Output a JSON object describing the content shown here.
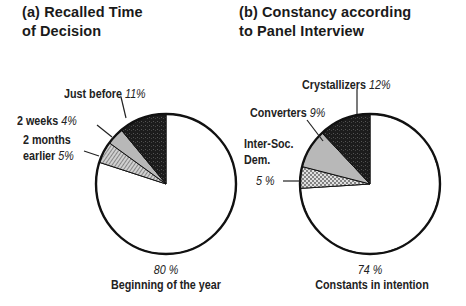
{
  "chart_data": [
    {
      "type": "pie",
      "title": "(a) Recalled Time of Decision",
      "title_lines": [
        "(a) Recalled Time",
        "of Decision"
      ],
      "start_angle": "12 o'clock, counterclockwise for small slices",
      "slices": [
        {
          "label": "Beginning of the year",
          "value": 80,
          "value_label": "80 %",
          "fill": "white"
        },
        {
          "label": "2 months earlier",
          "value": 5,
          "value_label": "5%",
          "fill": "hatched-gray"
        },
        {
          "label": "2 weeks",
          "value": 4,
          "value_label": "4%",
          "fill": "light-gray"
        },
        {
          "label": "Just before",
          "value": 11,
          "value_label": "11%",
          "fill": "black-stippled"
        }
      ]
    },
    {
      "type": "pie",
      "title": "(b) Constancy according to Panel Interview",
      "title_lines": [
        "(b) Constancy according",
        "to Panel Interview"
      ],
      "slices": [
        {
          "label": "Constants in intention",
          "value": 74,
          "value_label": "74 %",
          "fill": "white"
        },
        {
          "label": "Inter-Soc. Dem.",
          "value": 5,
          "value_label": "5 %",
          "fill": "dotted-gray"
        },
        {
          "label": "Converters",
          "value": 9,
          "value_label": "9%",
          "fill": "light-gray"
        },
        {
          "label": "Crystallizers",
          "value": 12,
          "value_label": "12%",
          "fill": "black-stippled"
        }
      ]
    }
  ],
  "titles": {
    "a_line1": "(a) Recalled Time",
    "a_line2": "of Decision",
    "b_line1": "(b) Constancy according",
    "b_line2": "to Panel Interview"
  },
  "labels_a": {
    "just_before": "Just before",
    "just_before_pct": "11%",
    "two_weeks": "2 weeks",
    "two_weeks_pct": "4%",
    "two_months_1": "2 months",
    "two_months_2": "earlier",
    "two_months_pct": "5%",
    "beginning_pct": "80 %",
    "beginning": "Beginning of the year"
  },
  "labels_b": {
    "crystallizers": "Crystallizers",
    "crystallizers_pct": "12%",
    "converters": "Converters",
    "converters_pct": "9%",
    "intersoc_1": "Inter-Soc.",
    "intersoc_2": "Dem.",
    "intersoc_pct": "5 %",
    "constants_pct": "74 %",
    "constants": "Constants in intention"
  },
  "colors": {
    "outline": "#111111",
    "dark": "#1c1c1c",
    "light_gray": "#b8b8b8",
    "hatch": "#8a8a8a",
    "white": "#ffffff"
  }
}
